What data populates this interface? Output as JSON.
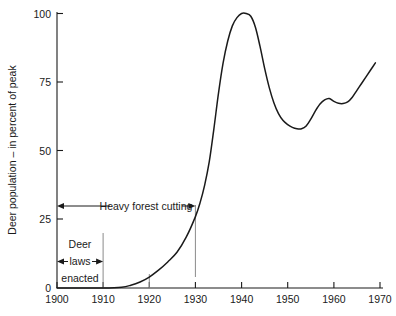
{
  "chart_data": {
    "type": "line",
    "title": "",
    "xlabel": "",
    "ylabel": "Deer population – in percent of peak",
    "xlim": [
      1900,
      1970
    ],
    "ylim": [
      0,
      100
    ],
    "grid": false,
    "legend": "none",
    "x_ticks": [
      "1900",
      "1910",
      "1920",
      "1930",
      "1940",
      "1950",
      "1960",
      "1970"
    ],
    "y_ticks": [
      "0",
      "25",
      "50",
      "75",
      "100"
    ],
    "series": [
      {
        "name": "Deer population",
        "x": [
          1900,
          1905,
          1910,
          1914,
          1916,
          1918,
          1920,
          1922,
          1924,
          1926,
          1928,
          1930,
          1931,
          1932,
          1933,
          1934,
          1935,
          1936,
          1937,
          1938,
          1939,
          1940,
          1941,
          1942,
          1943,
          1944,
          1945,
          1946,
          1947,
          1948,
          1949,
          1950,
          1951,
          1952,
          1953,
          1954,
          1955,
          1956,
          1957,
          1958,
          1959,
          1960,
          1961,
          1962,
          1963,
          1964,
          1965,
          1966,
          1967,
          1968,
          1969
        ],
        "y": [
          0,
          0,
          0,
          0.3,
          1.0,
          2.2,
          4.0,
          6.5,
          9.5,
          13.0,
          18.5,
          26.0,
          31.0,
          37.5,
          46.0,
          58.0,
          71.0,
          82.0,
          90.0,
          95.5,
          98.5,
          100.0,
          100.0,
          99.0,
          95.0,
          88.0,
          80.0,
          73.0,
          67.5,
          63.5,
          61.0,
          59.5,
          58.5,
          58.0,
          58.0,
          59.0,
          61.5,
          64.5,
          67.0,
          68.5,
          69.0,
          68.0,
          67.3,
          67.2,
          67.8,
          69.5,
          72.0,
          74.5,
          77.0,
          79.5,
          82.0
        ]
      }
    ],
    "annotations": [
      {
        "id": "heavy-forest-cutting",
        "text": "Heavy forest cutting",
        "x_start": 1900,
        "x_end": 1930,
        "y": 30,
        "style": "double-arrow"
      },
      {
        "id": "deer-laws-enacted",
        "lines": [
          "Deer",
          "laws",
          "enacted"
        ],
        "x_start": 1900,
        "x_end": 1910,
        "y": 9,
        "style": "double-arrow"
      }
    ],
    "markers": [
      {
        "id": "marker-1930",
        "x": 1930,
        "y_from": 4,
        "y_to": 30,
        "color": "#8a8a8a"
      },
      {
        "id": "marker-1910",
        "x": 1910,
        "y_from": 0,
        "y_to": 20,
        "color": "#8a8a8a"
      },
      {
        "id": "marker-1920",
        "x": 1920,
        "y_from": 0,
        "y_to": 5,
        "color": "#8a8a8a"
      }
    ]
  }
}
